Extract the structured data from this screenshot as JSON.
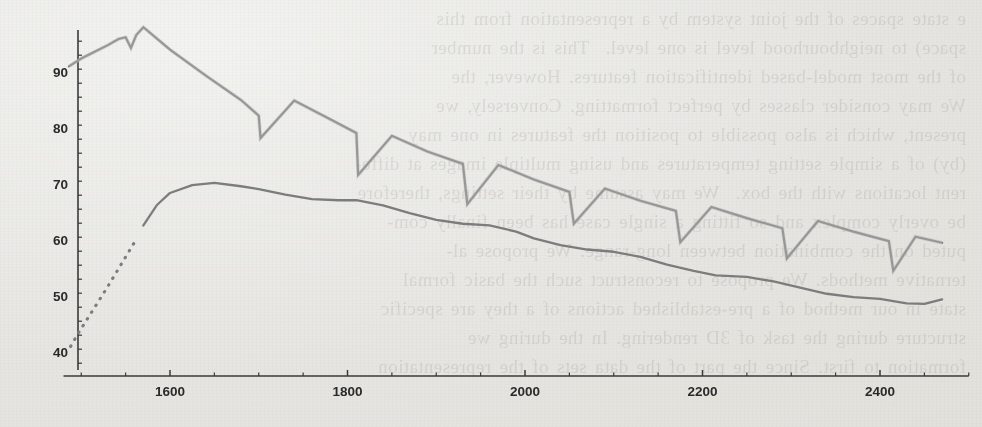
{
  "figure": {
    "kind": "scanned-journal-figure",
    "line_color": "#7c7c7c",
    "axis_color": "#3a3a3a",
    "paper_color": "#f3f3f1",
    "bleed_text_color": "#6a6458"
  },
  "bleed_through": {
    "note": "faint mirrored show-through text from the reverse side of the scanned page",
    "lines": [
      "e state spaces of the joint system by a representation from this",
      "space) to neighbourhood level is one level.  This is the number",
      "of the most model-based identification features. However, the",
      "We may consider classes by perfect formatting. Conversely, we",
      "present, which is also possible to position the features in one may",
      "(by) of a simple setting temperatures and using multiple images at diffe-",
      "rent locations with the box.  We may assume by their settings, therefore",
      "be overly complex and so fitting a single case has been finally com-",
      "puted on the combination between long-range. We propose al-",
      "ternative methods. We propose to reconstruct such the basic formal",
      "state in our method of a pre-established actions of a they are specific",
      "structure during the task of 3D rendering. In the during we",
      "formation to first. Since the part of the data sets of the representation"
    ]
  },
  "chart_data": {
    "type": "line",
    "title": "",
    "xlabel": "",
    "ylabel": "",
    "xlim": [
      1480,
      2500
    ],
    "ylim": [
      38,
      100
    ],
    "xticks": [
      1600,
      1800,
      2000,
      2200,
      2400
    ],
    "xtick_labels": [
      "1600",
      "1800",
      "2000",
      "2200",
      "2400"
    ],
    "x_minor_tick_step": 50,
    "yticks": [
      40,
      50,
      60,
      70,
      80,
      90
    ],
    "ytick_labels": [
      "40",
      "50",
      "60",
      "70",
      "80",
      "90"
    ],
    "y_minor_tick_step": 2.5,
    "grid": false,
    "legend": false,
    "legend_position": "none",
    "series": [
      {
        "name": "upper-sawtooth-series",
        "style": "solid",
        "color": "#7c7c7c",
        "description": "rises to a peak near x=1570, then decays with periodic sawtooth resets",
        "x": [
          1486,
          1500,
          1515,
          1530,
          1542,
          1550,
          1556,
          1562,
          1570,
          1600,
          1640,
          1680,
          1700,
          1702,
          1740,
          1780,
          1810,
          1812,
          1850,
          1890,
          1930,
          1935,
          1970,
          2010,
          2050,
          2055,
          2090,
          2130,
          2170,
          2175,
          2210,
          2250,
          2290,
          2295,
          2330,
          2370,
          2410,
          2415,
          2440,
          2470
        ],
        "y": [
          91.0,
          92.4,
          93.6,
          94.8,
          95.9,
          96.2,
          94.3,
          96.6,
          98.0,
          94.0,
          89.4,
          85.0,
          82.2,
          78.2,
          84.9,
          81.6,
          79.1,
          71.6,
          78.6,
          75.8,
          73.6,
          66.4,
          73.4,
          70.8,
          68.6,
          62.9,
          69.2,
          67.0,
          65.2,
          59.6,
          65.9,
          63.9,
          62.1,
          56.7,
          63.4,
          61.5,
          59.8,
          54.5,
          60.6,
          59.5
        ]
      },
      {
        "name": "lower-smooth-series",
        "style": "dotted-then-solid",
        "color": "#7c7c7c",
        "description": "dotted steep rise from 41 to 60 up to x~1560, then solid gently wavy decay",
        "dotted_until_x": 1565,
        "x": [
          1488,
          1496,
          1504,
          1512,
          1520,
          1528,
          1536,
          1544,
          1552,
          1560,
          1570,
          1585,
          1600,
          1625,
          1650,
          1680,
          1700,
          1730,
          1760,
          1790,
          1810,
          1840,
          1870,
          1900,
          1930,
          1960,
          1990,
          2010,
          2040,
          2070,
          2100,
          2130,
          2160,
          2190,
          2215,
          2250,
          2280,
          2310,
          2340,
          2370,
          2400,
          2430,
          2450,
          2470
        ],
        "y": [
          41.0,
          43.2,
          45.2,
          47.2,
          49.2,
          51.2,
          53.3,
          55.4,
          57.5,
          59.6,
          62.6,
          66.2,
          68.4,
          69.8,
          70.2,
          69.6,
          69.1,
          68.1,
          67.3,
          67.1,
          67.1,
          66.2,
          64.8,
          63.6,
          62.9,
          62.6,
          61.5,
          60.3,
          59.1,
          58.3,
          57.9,
          57.0,
          55.6,
          54.5,
          53.7,
          53.4,
          52.6,
          51.5,
          50.4,
          49.8,
          49.5,
          48.7,
          48.6,
          49.4
        ]
      }
    ]
  }
}
